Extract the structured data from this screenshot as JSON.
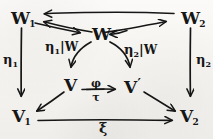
{
  "diagram": {
    "ink_color": "#161616",
    "paper_color": "#f5f4f0",
    "nodes": [
      {
        "id": "W1",
        "base": "W",
        "sub": "1",
        "prime": ""
      },
      {
        "id": "W2",
        "base": "W",
        "sub": "2",
        "prime": ""
      },
      {
        "id": "W",
        "base": "W",
        "sub": "",
        "prime": ""
      },
      {
        "id": "V",
        "base": "V",
        "sub": "",
        "prime": ""
      },
      {
        "id": "Vp",
        "base": "V",
        "sub": "",
        "prime": "′"
      },
      {
        "id": "V1",
        "base": "V",
        "sub": "1",
        "prime": ""
      },
      {
        "id": "V2",
        "base": "V",
        "sub": "2",
        "prime": ""
      }
    ],
    "edge_labels": {
      "eta1": {
        "glyph": "η",
        "sub": "1"
      },
      "eta2": {
        "glyph": "η",
        "sub": "2"
      },
      "eta1_restrict": {
        "glyph": "η",
        "sub": "1",
        "bar": "|",
        "target": "W"
      },
      "eta2_restrict": {
        "glyph": "η",
        "sub": "2",
        "bar": "|",
        "target": "W"
      },
      "phi_over_tau": {
        "numerator": "φ",
        "denominator": "τ"
      },
      "xi": {
        "glyph": "ξ"
      }
    }
  }
}
